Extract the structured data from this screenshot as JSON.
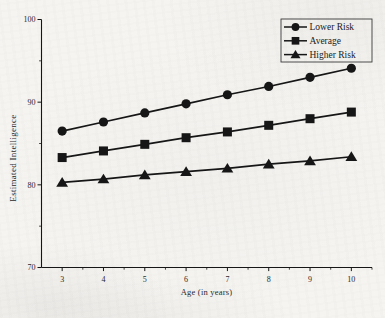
{
  "figure": {
    "background": "#f5f4f1",
    "ink": "#161616"
  },
  "chart_data": {
    "type": "line",
    "title": "",
    "xlabel": "Age (in years)",
    "ylabel": "Estimated Intelligence",
    "x": [
      3,
      4,
      5,
      6,
      7,
      8,
      9,
      10
    ],
    "xlim": [
      2.5,
      10.5
    ],
    "ylim": [
      70,
      100
    ],
    "xticks": [
      3,
      4,
      5,
      6,
      7,
      8,
      9,
      10
    ],
    "xticks_minor": [
      3.5,
      4.5,
      5.5,
      6.5,
      7.5,
      8.5,
      9.5,
      10.5
    ],
    "yticks": [
      100,
      90,
      80,
      70
    ],
    "yticks_minor": [
      95,
      85,
      75
    ],
    "grid": false,
    "legend_position": "top-right",
    "series": [
      {
        "name": "Lower Risk",
        "marker": "circle",
        "color": "#161616",
        "values": [
          86.5,
          87.6,
          88.7,
          89.8,
          90.9,
          91.9,
          93.0,
          94.1
        ]
      },
      {
        "name": "Average",
        "marker": "square",
        "color": "#161616",
        "values": [
          83.3,
          84.1,
          84.9,
          85.7,
          86.4,
          87.2,
          88.0,
          88.8
        ]
      },
      {
        "name": "Higher Risk",
        "marker": "triangle",
        "color": "#161616",
        "values": [
          80.3,
          80.7,
          81.2,
          81.6,
          82.0,
          82.5,
          82.9,
          83.4
        ]
      }
    ]
  }
}
